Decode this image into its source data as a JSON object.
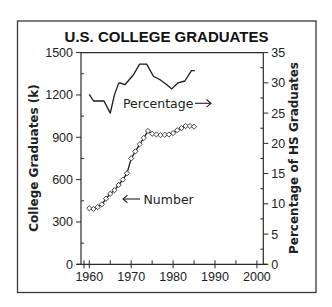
{
  "chart_data": {
    "type": "line",
    "title": "U.S. COLLEGE GRADUATES",
    "xlabel": "",
    "ylabel": "College Graduates (k)",
    "y2label": "Percentage of HS Graduates",
    "xlim": [
      1960,
      2000
    ],
    "ylim": [
      0,
      1500
    ],
    "y2lim": [
      0,
      35
    ],
    "xticks": [
      1960,
      1970,
      1980,
      1990,
      2000
    ],
    "yticks": [
      0,
      300,
      600,
      900,
      1200,
      1500
    ],
    "y2ticks": [
      0,
      5,
      10,
      15,
      20,
      25,
      30,
      35
    ],
    "grid": false,
    "legend": "inline annotations",
    "series": [
      {
        "name": "Number",
        "axis": "left",
        "marker": "diamond",
        "annotation": "← Number",
        "x": [
          1960,
          1961,
          1962,
          1963,
          1964,
          1965,
          1966,
          1967,
          1968,
          1969,
          1970,
          1971,
          1972,
          1973,
          1974,
          1975,
          1976,
          1977,
          1978,
          1979,
          1980,
          1981,
          1982,
          1983,
          1984,
          1985
        ],
        "values": [
          397,
          392,
          405,
          425,
          465,
          500,
          525,
          562,
          600,
          645,
          750,
          800,
          850,
          895,
          945,
          925,
          920,
          915,
          918,
          920,
          930,
          950,
          965,
          980,
          980,
          975
        ]
      },
      {
        "name": "Percentage",
        "axis": "right",
        "marker": "none",
        "annotation": "Percentage →",
        "x": [
          1960,
          1961,
          1963.5,
          1965,
          1966,
          1967,
          1967.3,
          1968.5,
          1970.5,
          1972,
          1973.7,
          1975.3,
          1976.9,
          1978.5,
          1979.7,
          1981.2,
          1982.8,
          1984.4,
          1985.2
        ],
        "values": [
          28.1,
          27.0,
          27.0,
          25.0,
          28.0,
          29.9,
          30.0,
          29.7,
          31.3,
          33.1,
          33.1,
          31.1,
          30.5,
          29.7,
          29.0,
          30.0,
          30.3,
          32.0,
          32.0
        ]
      }
    ]
  },
  "labels": {
    "number_annotation": "Number",
    "percentage_annotation": "Percentage"
  },
  "colors": {
    "line": "#1a1a1a",
    "frame": "#3a3a3a",
    "background": "#ffffff"
  }
}
